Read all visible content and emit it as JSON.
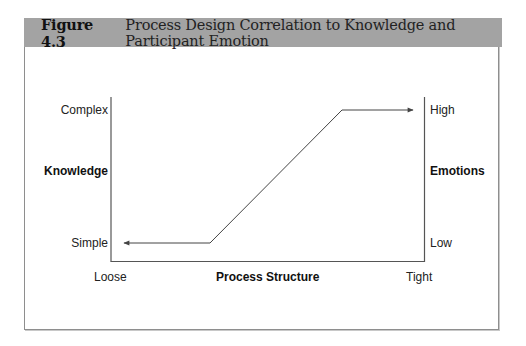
{
  "figure": {
    "number": "Figure 4.3",
    "title": "Process Design Correlation to Knowledge and Participant Emotion"
  },
  "colors": {
    "header_bg": "#a3a3a3",
    "frame_border": "#8e8e8e",
    "line": "#444444"
  },
  "diagram": {
    "left_axis": {
      "title": "Knowledge",
      "top_label": "Complex",
      "bottom_label": "Simple"
    },
    "right_axis": {
      "title": "Emotions",
      "top_label": "High",
      "bottom_label": "Low"
    },
    "bottom_axis": {
      "title": "Process Structure",
      "left_label": "Loose",
      "right_label": "Tight"
    },
    "curve": {
      "description": "Flat at Simple/Low for loose structure, rising diagonally, then flat at Complex/High for tight structure; arrowheads point outward to both ends",
      "points": [
        [
          122,
          243
        ],
        [
          210,
          243
        ],
        [
          342,
          110
        ],
        [
          415,
          110
        ]
      ]
    }
  }
}
